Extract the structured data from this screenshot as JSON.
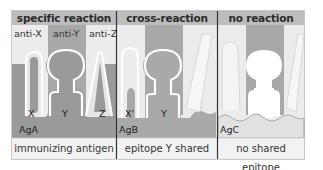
{
  "panels": [
    {
      "title": "specific reaction",
      "antibodies": [
        "anti-X",
        "anti-Y",
        "anti-Z"
      ],
      "epitopes": [
        "X",
        "Y",
        "Z"
      ],
      "antigen": "AgA",
      "caption": "immunizing antigen"
    },
    {
      "title": "cross-reaction",
      "epitopes": [
        "X'",
        "Y"
      ],
      "antigen": "AgB",
      "caption": "epitope Y shared"
    },
    {
      "title": "no reaction",
      "antigen": "AgC",
      "caption": "no shared epitope"
    }
  ],
  "colors": {
    "header_bg": "#bdbdbd",
    "antigen_dark": "#9a9a9a",
    "antigen_mid": "#a9a9a9",
    "antigen_light": "#e2e2e2",
    "antibody_column": "#a8a8a8",
    "caption_bg": "#f2f2f2",
    "divider": "#333333"
  }
}
